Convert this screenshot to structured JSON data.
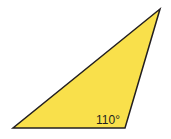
{
  "diagram": {
    "shape": "triangle",
    "fill_color": "#f9e04b",
    "stroke_color": "#231f20",
    "vertices": [
      [
        13,
        128
      ],
      [
        125,
        128
      ],
      [
        160,
        9
      ]
    ],
    "angle_label": "110°"
  }
}
